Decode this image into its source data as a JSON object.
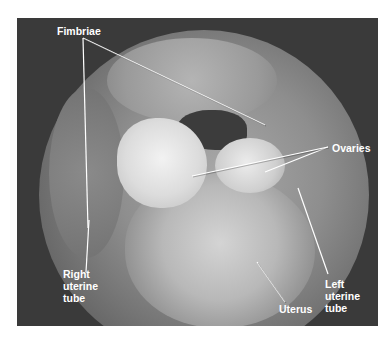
{
  "figure": {
    "labels": {
      "fimbriae": "Fimbriae",
      "ovaries": "Ovaries",
      "right_uterine_tube": "Right\nuterine\ntube",
      "left_uterine_tube": "Left\nuterine\ntube",
      "uterus": "Uterus"
    },
    "colors": {
      "background": "#3a3a3a",
      "label_text": "#ffffff",
      "leader_line": "#ffffff"
    }
  }
}
